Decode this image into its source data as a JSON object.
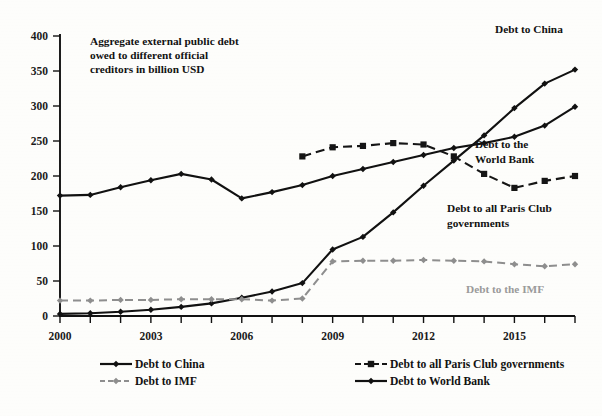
{
  "chart_data": {
    "type": "line",
    "title": "Aggregate external public debt owed to different official creditors in billion USD",
    "title_lines": [
      "Aggregate external public debt",
      "owed to different official",
      "creditors in billion USD"
    ],
    "xlabel": "",
    "ylabel": "",
    "xlim": [
      2000,
      2017
    ],
    "ylim": [
      0,
      400
    ],
    "yticks": [
      0,
      50,
      100,
      150,
      200,
      250,
      300,
      350,
      400
    ],
    "ytick_labels": [
      "0",
      "50",
      "100",
      "150",
      "200",
      "250",
      "300",
      "350",
      "400"
    ],
    "xticks": [
      2000,
      2001,
      2002,
      2003,
      2004,
      2005,
      2006,
      2007,
      2008,
      2009,
      2010,
      2011,
      2012,
      2013,
      2014,
      2015,
      2016,
      2017
    ],
    "xtick_labels_shown": [
      "2000",
      "2003",
      "2006",
      "2009",
      "2012",
      "2015"
    ],
    "xtick_label_years": [
      2000,
      2003,
      2006,
      2009,
      2012,
      2015
    ],
    "grid": false,
    "legend_position": "bottom",
    "x": [
      2000,
      2001,
      2002,
      2003,
      2004,
      2005,
      2006,
      2007,
      2008,
      2009,
      2010,
      2011,
      2012,
      2013,
      2014,
      2015,
      2016,
      2017
    ],
    "series": [
      {
        "name": "Debt to China",
        "style": "solid",
        "marker": "diamond",
        "color": "#111111",
        "x": [
          2000,
          2001,
          2002,
          2003,
          2004,
          2005,
          2006,
          2007,
          2008,
          2009,
          2010,
          2011,
          2012,
          2013,
          2014,
          2015,
          2016,
          2017
        ],
        "values": [
          3,
          4,
          6,
          9,
          13,
          18,
          26,
          35,
          47,
          95,
          113,
          148,
          186,
          222,
          258,
          297,
          332,
          352
        ]
      },
      {
        "name": "Debt to World Bank",
        "style": "solid",
        "marker": "diamond",
        "color": "#111111",
        "x": [
          2000,
          2001,
          2002,
          2003,
          2004,
          2005,
          2006,
          2007,
          2008,
          2009,
          2010,
          2011,
          2012,
          2013,
          2014,
          2015,
          2016,
          2017
        ],
        "values": [
          172,
          173,
          184,
          194,
          203,
          195,
          168,
          177,
          187,
          200,
          210,
          220,
          230,
          240,
          247,
          256,
          272,
          299
        ]
      },
      {
        "name": "Debt to all Paris Club governments",
        "style": "dashed",
        "marker": "square",
        "color": "#151515",
        "x": [
          2008,
          2009,
          2010,
          2011,
          2012,
          2013,
          2014,
          2015,
          2016,
          2017
        ],
        "values": [
          228,
          241,
          243,
          247,
          245,
          228,
          203,
          183,
          193,
          200
        ]
      },
      {
        "name": "Debt to IMF",
        "style": "dashed",
        "marker": "diamond",
        "color": "#8e8e8e",
        "x": [
          2000,
          2001,
          2002,
          2003,
          2004,
          2005,
          2006,
          2007,
          2008,
          2009,
          2010,
          2011,
          2012,
          2013,
          2014,
          2015,
          2016,
          2017
        ],
        "values": [
          22,
          22,
          23,
          23,
          24,
          24,
          24,
          22,
          25,
          78,
          79,
          79,
          80,
          79,
          78,
          74,
          71,
          74
        ]
      }
    ],
    "annotations": [
      {
        "text": "Debt to China",
        "x": 2016,
        "y": 378,
        "color": "#121212"
      },
      {
        "text_lines": [
          "Debt to the",
          "World Bank"
        ],
        "x": 2015,
        "y": 247,
        "color": "#121212"
      },
      {
        "text_lines": [
          "Debt to all Paris Club",
          "governments"
        ],
        "x": 2014,
        "y": 168,
        "color": "#121212"
      },
      {
        "text": "Debt to the IMF",
        "x": 2015,
        "y": 57,
        "color": "#9a9a9a"
      }
    ]
  },
  "legend": {
    "entries": [
      {
        "label": "Debt to China",
        "style": "solid",
        "marker": "diamond",
        "color": "#111111"
      },
      {
        "label": "Debt to all Paris Club governments",
        "style": "dashed",
        "marker": "square",
        "color": "#151515"
      },
      {
        "label": "Debt to IMF",
        "style": "dashed",
        "marker": "diamond",
        "color": "#8e8e8e"
      },
      {
        "label": "Debt to World Bank",
        "style": "solid",
        "marker": "diamond",
        "color": "#111111"
      }
    ]
  }
}
